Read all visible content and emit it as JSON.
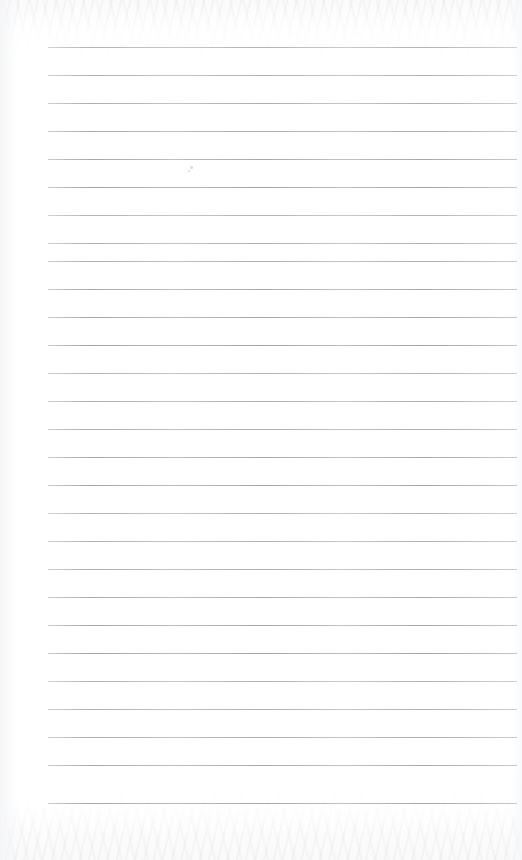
{
  "page": {
    "kind": "scanned-lined-notebook-page",
    "width": 522,
    "height": 860,
    "background_color": "#ffffff",
    "content_text": "",
    "handwriting_present": "none",
    "printed_text_present": "none"
  },
  "ruling": {
    "style": "horizontal-ruled",
    "line_color": "#9fa2a8",
    "line_thickness_px": 1,
    "line_count": 28,
    "line_start_x": 48,
    "line_end_x": 517,
    "first_line_y": 47,
    "line_spacing_px": 28,
    "margin_rule": "none",
    "left_margin_px": 48,
    "right_margin_px": 5,
    "top_margin_px": 47,
    "bottom_margin_px": 57,
    "lines_y": [
      47,
      75,
      103,
      131,
      159,
      187,
      215,
      243,
      261,
      289,
      317,
      345,
      373,
      401,
      429,
      457,
      485,
      513,
      541,
      569,
      597,
      625,
      653,
      681,
      709,
      737,
      765,
      803
    ]
  },
  "texture": {
    "scan_noise": "faint mottled gray at top and bottom edges",
    "top_band_height_px": 40,
    "bottom_band_height_px": 52,
    "paper_tone": "#fdfdfe"
  },
  "marks": [
    {
      "name": "faint-speck-upper",
      "x": 190,
      "y": 166,
      "size": 3
    },
    {
      "name": "faint-speck-mid",
      "x": 188,
      "y": 170,
      "size": 2
    }
  ]
}
